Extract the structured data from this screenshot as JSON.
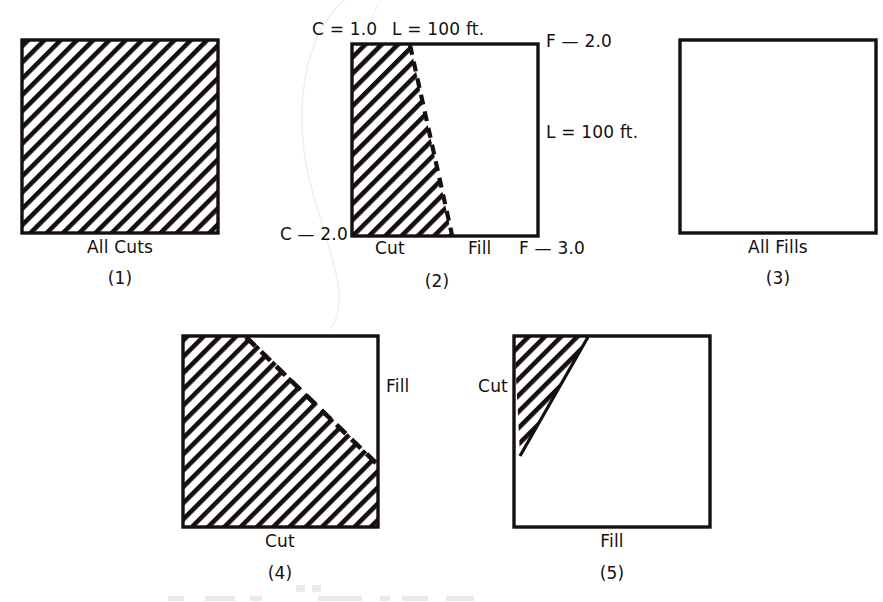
{
  "figure": {
    "type": "engineering-diagram",
    "background_color": "#ffffff",
    "ink_color": "#15100e",
    "hatch_meaning": "cut area",
    "blank_meaning": "fill area"
  },
  "panels": [
    {
      "id": "1",
      "number": "(1)",
      "caption": "All Cuts",
      "region": "fully-hatched",
      "labels": []
    },
    {
      "id": "2",
      "number": "(2)",
      "caption": "",
      "region": "partial-hatched-left",
      "labels": [
        {
          "name": "corner-top-left",
          "text": "C = 1.0"
        },
        {
          "name": "top-length",
          "text": "L = 100 ft."
        },
        {
          "name": "corner-top-right",
          "text": "F — 2.0"
        },
        {
          "name": "right-length",
          "text": "L = 100 ft."
        },
        {
          "name": "corner-bottom-left",
          "text": "C — 2.0"
        },
        {
          "name": "bottom-cut",
          "text": "Cut"
        },
        {
          "name": "bottom-fill",
          "text": "Fill"
        },
        {
          "name": "corner-bottom-right",
          "text": "F — 3.0"
        }
      ]
    },
    {
      "id": "3",
      "number": "(3)",
      "caption": "All Fills",
      "region": "empty",
      "labels": []
    },
    {
      "id": "4",
      "number": "(4)",
      "caption": "Cut",
      "region": "hatched-lower-left-triangle",
      "labels": [
        {
          "name": "right-fill",
          "text": "Fill"
        }
      ]
    },
    {
      "id": "5",
      "number": "(5)",
      "caption": "Fill",
      "region": "hatched-upper-left-triangle",
      "labels": [
        {
          "name": "left-cut",
          "text": "Cut"
        }
      ]
    }
  ],
  "geometry": {
    "panel1": {
      "x": 22,
      "y": 40,
      "w": 196,
      "h": 193
    },
    "panel2": {
      "x": 352,
      "y": 44,
      "w": 186,
      "h": 192
    },
    "panel3": {
      "x": 680,
      "y": 40,
      "w": 196,
      "h": 193
    },
    "panel4": {
      "x": 183,
      "y": 336,
      "w": 195,
      "h": 191
    },
    "panel5": {
      "x": 514,
      "y": 336,
      "w": 196,
      "h": 191
    }
  }
}
